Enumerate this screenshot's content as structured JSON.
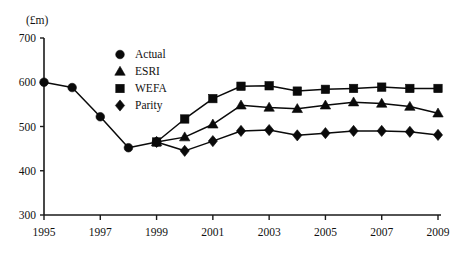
{
  "chart_data": {
    "type": "line",
    "title": "",
    "subtitle": "",
    "xlabel": "",
    "ylabel": "",
    "unit_label": "(£m)",
    "grid": false,
    "legend_position": "top-center",
    "xlim": [
      1995,
      2009
    ],
    "ylim": [
      300,
      700
    ],
    "ytick_labels": [
      "700",
      "600",
      "500",
      "400",
      "300"
    ],
    "ytick_values": [
      700,
      600,
      500,
      400,
      300
    ],
    "xtick_labels": [
      "1995",
      "1997",
      "1999",
      "2001",
      "2003",
      "2005",
      "2007",
      "2009"
    ],
    "xtick_values": [
      1995,
      1997,
      1999,
      2001,
      2003,
      2005,
      2007,
      2009
    ],
    "x": [
      1995,
      1996,
      1997,
      1998,
      1999,
      2000,
      2001,
      2002,
      2003,
      2004,
      2005,
      2006,
      2007,
      2008,
      2009
    ],
    "series": [
      {
        "name": "Actual",
        "marker": "circle",
        "x": [
          1995,
          1996,
          1997,
          1998,
          1999
        ],
        "values": [
          600,
          588,
          522,
          452,
          465
        ]
      },
      {
        "name": "ESRI",
        "marker": "triangle",
        "x": [
          1999,
          2000,
          2001,
          2002,
          2003,
          2004,
          2005,
          2006,
          2007,
          2008,
          2009
        ],
        "values": [
          465,
          476,
          505,
          548,
          543,
          540,
          548,
          555,
          552,
          545,
          530
        ]
      },
      {
        "name": "WEFA",
        "marker": "square",
        "x": [
          1999,
          2000,
          2001,
          2002,
          2003,
          2004,
          2005,
          2006,
          2007,
          2008,
          2009
        ],
        "values": [
          465,
          517,
          563,
          591,
          592,
          580,
          584,
          586,
          589,
          586,
          586
        ]
      },
      {
        "name": "Parity",
        "marker": "diamond",
        "x": [
          1999,
          2000,
          2001,
          2002,
          2003,
          2004,
          2005,
          2006,
          2007,
          2008,
          2009
        ],
        "values": [
          465,
          445,
          467,
          490,
          492,
          480,
          485,
          490,
          490,
          488,
          481
        ]
      }
    ],
    "legend": [
      {
        "label": "Actual",
        "marker": "circle"
      },
      {
        "label": "ESRI",
        "marker": "triangle"
      },
      {
        "label": "WEFA",
        "marker": "square"
      },
      {
        "label": "Parity",
        "marker": "diamond"
      }
    ],
    "colors": {
      "ink": "#0a0a0a",
      "background": "#ffffff"
    }
  }
}
